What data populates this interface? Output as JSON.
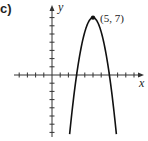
{
  "figure": {
    "part_label": "c)",
    "x_axis_label": "x",
    "y_axis_label": "y",
    "vertex_annotation": "(5, 7)"
  },
  "chart_data": {
    "type": "line",
    "title": "",
    "xlabel": "x",
    "ylabel": "y",
    "xlim": [
      -5,
      11
    ],
    "ylim": [
      -7,
      8
    ],
    "grid": false,
    "tick_spacing": 1,
    "series": [
      {
        "name": "parabola",
        "equation": "y = 7 - 1.75(x - 5)^2",
        "vertex": [
          5,
          7
        ],
        "roots": [
          3,
          7
        ],
        "x": [
          2.2,
          3,
          4,
          5,
          6,
          7,
          7.8
        ],
        "y": [
          -6.7,
          0,
          5.25,
          7,
          5.25,
          0,
          -6.7
        ]
      }
    ],
    "annotations": [
      {
        "text": "(5, 7)",
        "x": 5,
        "y": 7,
        "marker": "dot"
      }
    ],
    "colors": {
      "curve": "#111111",
      "axes": "#333333"
    }
  }
}
